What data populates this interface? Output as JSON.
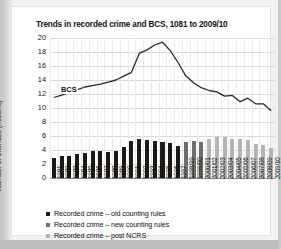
{
  "title": "Trends in recorded crime and BCS, 1081 to 2009/10",
  "bcs_annotation": "BCS",
  "legend": [
    {
      "label": "Recorded crime – old counting rules",
      "color": "#1a1a1a"
    },
    {
      "label": "Recorded crime – new counting rules",
      "color": "#6e6e6e"
    },
    {
      "label": "Recorded crime – post NCRS",
      "color": "#b4b4b4"
    }
  ],
  "chart_data": {
    "type": "bar",
    "title": "Trends in recorded crime and BCS, 1081 to 2009/10",
    "xlabel": "",
    "ylabel": "Number of offences (millions)",
    "ylim": [
      0,
      20
    ],
    "yticks": [
      0,
      2,
      4,
      6,
      8,
      10,
      12,
      14,
      16,
      18,
      20
    ],
    "grid": true,
    "legend_position": "below",
    "categories": [
      "1981",
      "1982",
      "1983",
      "1984",
      "1985",
      "1986",
      "1987",
      "1988",
      "1989",
      "1990",
      "1991",
      "1992",
      "1993",
      "1994",
      "1995",
      "1996",
      "1997",
      "1998/99",
      "1999/00",
      "2000/01",
      "2001/02",
      "2002/03",
      "2003/04",
      "2004/05",
      "2005/06",
      "2006/07",
      "2007/08",
      "2008/09",
      "2009/10"
    ],
    "series": [
      {
        "name": "Recorded crime – old counting rules",
        "type": "bar",
        "color": "#1a1a1a",
        "values": [
          2.8,
          3.2,
          3.2,
          3.5,
          3.6,
          3.8,
          3.9,
          3.7,
          3.9,
          4.5,
          5.3,
          5.6,
          5.5,
          5.3,
          5.1,
          5.0,
          4.6,
          null,
          null,
          null,
          null,
          null,
          null,
          null,
          null,
          null,
          null,
          null,
          null
        ]
      },
      {
        "name": "Recorded crime – new counting rules",
        "type": "bar",
        "color": "#6e6e6e",
        "values": [
          null,
          null,
          null,
          null,
          null,
          null,
          null,
          null,
          null,
          null,
          null,
          null,
          null,
          null,
          null,
          null,
          null,
          5.1,
          5.3,
          5.2,
          5.5,
          null,
          null,
          null,
          null,
          null,
          null,
          null,
          null
        ]
      },
      {
        "name": "Recorded crime – post NCRS",
        "type": "bar",
        "color": "#b4b4b4",
        "values": [
          null,
          null,
          null,
          null,
          null,
          null,
          null,
          null,
          null,
          null,
          null,
          null,
          null,
          null,
          null,
          null,
          null,
          null,
          null,
          null,
          5.6,
          5.9,
          5.9,
          5.6,
          5.6,
          5.4,
          4.9,
          4.7,
          4.3
        ]
      },
      {
        "name": "BCS",
        "type": "line",
        "color": "#2b2b2b",
        "values": [
          11.5,
          null,
          12.2,
          null,
          13.0,
          null,
          13.4,
          null,
          14.0,
          null,
          15.1,
          17.8,
          18.3,
          19.0,
          19.4,
          18.2,
          16.5,
          14.6,
          13.6,
          12.9,
          12.5,
          12.3,
          11.7,
          11.8,
          10.9,
          11.4,
          10.6,
          10.6,
          9.6
        ]
      }
    ],
    "annotations": [
      {
        "text": "BCS",
        "x": "1983",
        "y": 12.6
      }
    ]
  }
}
